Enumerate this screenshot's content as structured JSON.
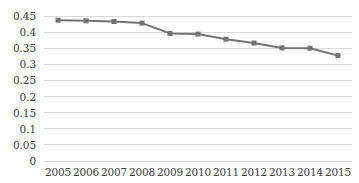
{
  "chart_data": {
    "type": "line",
    "title": "",
    "subtitle": "",
    "xlabel": "",
    "ylabel": "",
    "categories": [
      "2005",
      "2006",
      "2007",
      "2008",
      "2009",
      "2010",
      "2011",
      "2012",
      "2013",
      "2014",
      "2015"
    ],
    "series": [
      {
        "name": "",
        "values": [
          0.437,
          0.435,
          0.433,
          0.428,
          0.396,
          0.394,
          0.378,
          0.366,
          0.351,
          0.35,
          0.327
        ]
      }
    ],
    "ylim": [
      0,
      0.45
    ],
    "yticks": [
      0,
      0.05,
      0.1,
      0.15,
      0.2,
      0.25,
      0.3,
      0.35,
      0.4,
      0.45
    ],
    "ytick_labels": [
      "0",
      "0.05",
      "0.1",
      "0.15",
      "0.2",
      "0.25",
      "0.3",
      "0.35",
      "0.4",
      "0.45"
    ],
    "xtick_labels": [
      "2005",
      "2006",
      "2007",
      "2008",
      "2009",
      "2010",
      "2011",
      "2012",
      "2013",
      "2014",
      "2015"
    ],
    "grid": {
      "horizontal": true,
      "vertical": false,
      "color": "#d9d9d9"
    },
    "legend": {
      "visible": false,
      "position": "none",
      "entries": []
    },
    "colors": {
      "line": "#737373",
      "marker": "#737373",
      "gridline": "#d9d9d9",
      "axis_text": "#3b3b3b",
      "background": "#ffffff"
    },
    "marker": {
      "shape": "square",
      "size": 5
    },
    "line_width": 2
  }
}
